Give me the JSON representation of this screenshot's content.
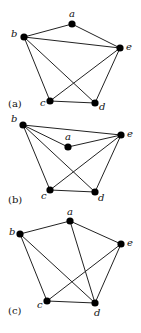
{
  "figure": {
    "graphs": [
      {
        "panel_label": "(a)",
        "panel_label_pos": [
          8,
          107
        ],
        "vertices": {
          "a": {
            "x": 72,
            "y": 24,
            "label": "a",
            "lx": 69,
            "ly": 17
          },
          "b": {
            "x": 24,
            "y": 37,
            "label": "b",
            "lx": 11,
            "ly": 37
          },
          "e": {
            "x": 120,
            "y": 48,
            "label": "e",
            "lx": 126,
            "ly": 50
          },
          "c": {
            "x": 50,
            "y": 101,
            "label": "c",
            "lx": 40,
            "ly": 106
          },
          "d": {
            "x": 95,
            "y": 103,
            "label": "d",
            "lx": 99,
            "ly": 110
          }
        },
        "edges": [
          [
            "b",
            "a"
          ],
          [
            "a",
            "e"
          ],
          [
            "b",
            "e"
          ],
          [
            "b",
            "c"
          ],
          [
            "b",
            "d"
          ],
          [
            "c",
            "e"
          ],
          [
            "e",
            "d"
          ],
          [
            "c",
            "d"
          ]
        ]
      },
      {
        "panel_label": "(b)",
        "panel_label_pos": [
          8,
          203
        ],
        "vertices": {
          "b": {
            "x": 23,
            "y": 125,
            "label": "b",
            "lx": 11,
            "ly": 122
          },
          "e": {
            "x": 121,
            "y": 135,
            "label": "e",
            "lx": 127,
            "ly": 137
          },
          "a": {
            "x": 68,
            "y": 147,
            "label": "a",
            "lx": 65,
            "ly": 140
          },
          "c": {
            "x": 50,
            "y": 190,
            "label": "c",
            "lx": 41,
            "ly": 199
          },
          "d": {
            "x": 95,
            "y": 192,
            "label": "d",
            "lx": 98,
            "ly": 201
          }
        },
        "edges": [
          [
            "b",
            "e"
          ],
          [
            "b",
            "a"
          ],
          [
            "a",
            "e"
          ],
          [
            "b",
            "c"
          ],
          [
            "b",
            "d"
          ],
          [
            "c",
            "e"
          ],
          [
            "e",
            "d"
          ],
          [
            "c",
            "d"
          ]
        ]
      },
      {
        "panel_label": "(c)",
        "panel_label_pos": [
          8,
          314
        ],
        "vertices": {
          "a": {
            "x": 70,
            "y": 221,
            "label": "a",
            "lx": 67,
            "ly": 215
          },
          "b": {
            "x": 20,
            "y": 234,
            "label": "b",
            "lx": 9,
            "ly": 235
          },
          "e": {
            "x": 121,
            "y": 244,
            "label": "e",
            "lx": 127,
            "ly": 246
          },
          "c": {
            "x": 47,
            "y": 301,
            "label": "c",
            "lx": 37,
            "ly": 308
          },
          "d": {
            "x": 95,
            "y": 303,
            "label": "d",
            "lx": 94,
            "ly": 316
          }
        },
        "edges": [
          [
            "b",
            "a"
          ],
          [
            "a",
            "e"
          ],
          [
            "a",
            "d"
          ],
          [
            "b",
            "c"
          ],
          [
            "b",
            "d"
          ],
          [
            "c",
            "e"
          ],
          [
            "e",
            "d"
          ],
          [
            "c",
            "d"
          ]
        ]
      }
    ],
    "vertex_radius": 3.6,
    "colors": {
      "edge": "#222222",
      "vertex": "#000000",
      "text": "#111111"
    }
  }
}
